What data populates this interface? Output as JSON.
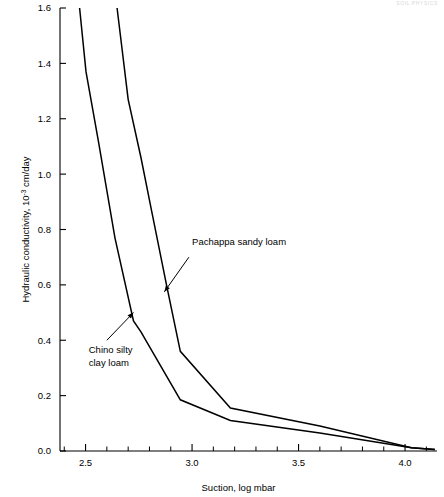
{
  "header": {
    "running_head": "SOIL PHYSICS"
  },
  "chart_data": {
    "type": "line",
    "title": "",
    "xlabel": "Suction, log mbar",
    "ylabel": "Hydraulic conductivity, 10",
    "ylabel_exponent": "-3",
    "ylabel_tail": " cm/day",
    "xlim": [
      2.38,
      4.15
    ],
    "ylim": [
      0.0,
      1.6
    ],
    "grid": false,
    "legend": "annotations",
    "xticks": [
      2.5,
      3.0,
      3.5,
      4.0
    ],
    "xticklabels": [
      "2.5",
      "3.0",
      "3.5",
      "4.0"
    ],
    "xminorticks": [
      2.4,
      2.6,
      2.7,
      2.8,
      2.9,
      3.1,
      3.2,
      3.3,
      3.4,
      3.6,
      3.7,
      3.8,
      3.9,
      4.1
    ],
    "yticks": [
      0.0,
      0.2,
      0.4,
      0.6,
      0.8,
      1.0,
      1.2,
      1.4,
      1.6
    ],
    "yticklabels": [
      "0.0",
      "0.2",
      "0.4",
      "0.6",
      "0.8",
      "1.0",
      "1.2",
      "1.4",
      "1.6"
    ],
    "series": [
      {
        "name": "Chino silty clay loam",
        "color": "#000000",
        "x": [
          2.472,
          2.502,
          2.56,
          2.638,
          2.725,
          2.76,
          2.945,
          3.18,
          3.6,
          4.03,
          4.14
        ],
        "y": [
          1.6,
          1.37,
          1.12,
          0.77,
          0.47,
          0.43,
          0.185,
          0.11,
          0.065,
          0.012,
          0.005
        ]
      },
      {
        "name": "Pachappa sandy loam",
        "color": "#000000",
        "x": [
          2.648,
          2.7,
          2.76,
          2.812,
          2.88,
          2.945,
          3.18,
          3.6,
          4.03,
          4.14
        ],
        "y": [
          1.6,
          1.27,
          1.06,
          0.86,
          0.6,
          0.36,
          0.155,
          0.09,
          0.012,
          0.005
        ]
      }
    ],
    "annotations": [
      {
        "id": "pachappa-label",
        "text": "Pachappa sandy loam",
        "lines": [
          "Pachappa sandy loam"
        ],
        "label_x": 3.0,
        "label_y": 0.745,
        "arrow_from_x": 2.985,
        "arrow_from_y": 0.7,
        "arrow_to_x": 2.87,
        "arrow_to_y": 0.575
      },
      {
        "id": "chino-label",
        "text": "Chino silty clay loam",
        "lines": [
          "Chino silty",
          "clay loam"
        ],
        "label_x": 2.515,
        "label_y": 0.355,
        "arrow_from_x": 2.6,
        "arrow_from_y": 0.4,
        "arrow_to_x": 2.725,
        "arrow_to_y": 0.5
      }
    ]
  }
}
